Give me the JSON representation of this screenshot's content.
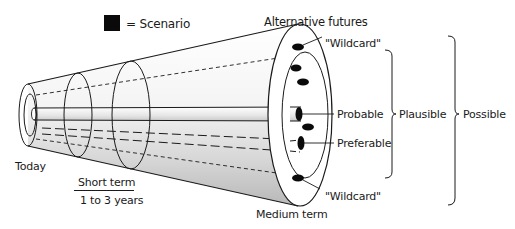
{
  "legend": {
    "swatch_color": "#0a0a0a",
    "label": "= Scenario"
  },
  "labels": {
    "alternative_futures": "Alternative futures",
    "wildcard_top": "\"Wildcard\"",
    "wildcard_bottom": "\"Wildcard\"",
    "probable": "Probable",
    "preferable": "Preferable",
    "plausible": "Plausible",
    "possible": "Possible",
    "today": "Today",
    "short_term": "Short term",
    "short_term_range": "1 to 3 years",
    "medium_term": "Medium term"
  },
  "diagram": {
    "type": "futures-cone",
    "scenario_count": 7,
    "colors": {
      "stroke": "#1a1a1a",
      "cone_fill_light": "#ffffff",
      "cone_fill_dark": "#bdbdbd",
      "scenario": "#0a0a0a"
    }
  }
}
